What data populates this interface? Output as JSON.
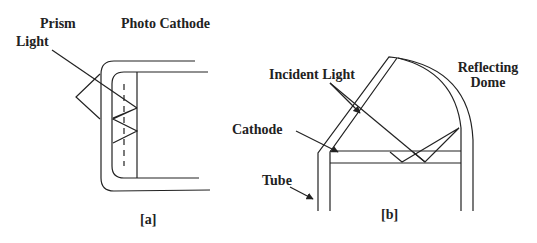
{
  "figure_a": {
    "caption": "[a]",
    "labels": {
      "prism": "Prism",
      "photo_cathode": "Photo Cathode",
      "light": "Light"
    }
  },
  "figure_b": {
    "caption": "[b]",
    "labels": {
      "incident_light": "Incident Light",
      "reflecting_dome_line1": "Reflecting",
      "reflecting_dome_line2": "Dome",
      "cathode": "Cathode",
      "tube": "Tube"
    }
  },
  "colors": {
    "line": "#222222",
    "background": "#ffffff"
  }
}
